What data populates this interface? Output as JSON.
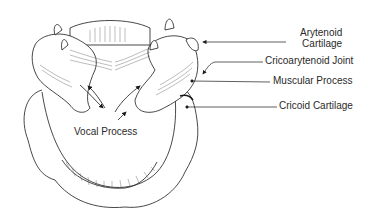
{
  "diagram": {
    "labels": {
      "arytenoid_line1": "Arytenoid",
      "arytenoid_line2": "Cartilage",
      "cricoarytenoid_joint": "Cricoarytenoid Joint",
      "muscular_process": "Muscular Process",
      "cricoid_cartilage": "Cricoid Cartilage",
      "vocal_process": "Vocal Process"
    },
    "colors": {
      "line": "#1a1a1a",
      "background": "#ffffff",
      "text": "#2a2a2a"
    }
  }
}
